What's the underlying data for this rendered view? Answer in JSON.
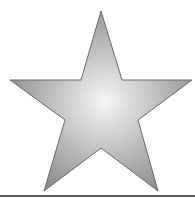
{
  "image": {
    "subject": "star-icon",
    "fill_center": "#f4f4f4",
    "fill_edge": "#8a8a8a",
    "stroke": "#6a6a6a",
    "baseline_color": "#555555"
  }
}
